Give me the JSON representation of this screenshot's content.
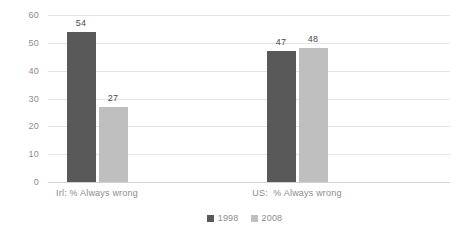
{
  "chart_data": {
    "type": "bar",
    "title": "",
    "subtitle": "",
    "xlabel": "",
    "ylabel": "",
    "ylim": [
      0,
      60
    ],
    "yticks": [
      "0",
      "10",
      "20",
      "30",
      "40",
      "50",
      "60"
    ],
    "grid": true,
    "legend_position": "bottom-center",
    "categories": [
      "Irl: % Always wrong",
      "US:  % Always wrong"
    ],
    "series": [
      {
        "name": "1998",
        "color": "#595959",
        "values": [
          54,
          47
        ]
      },
      {
        "name": "2008",
        "color": "#bfbfbf",
        "values": [
          27,
          48
        ]
      }
    ],
    "data_labels": [
      "54",
      "27",
      "47",
      "48"
    ]
  },
  "axis": {
    "ticks": [
      {
        "label": "60",
        "value": 60
      },
      {
        "label": "50",
        "value": 50
      },
      {
        "label": "40",
        "value": 40
      },
      {
        "label": "30",
        "value": 30
      },
      {
        "label": "20",
        "value": 20
      },
      {
        "label": "10",
        "value": 10
      },
      {
        "label": "0",
        "value": 0
      }
    ]
  },
  "bars": [
    {
      "name": "bar-irl-1998",
      "series": "1998",
      "category": "Irl: % Always wrong",
      "value": 54,
      "label": "54"
    },
    {
      "name": "bar-irl-2008",
      "series": "2008",
      "category": "Irl: % Always wrong",
      "value": 27,
      "label": "27"
    },
    {
      "name": "bar-us-1998",
      "series": "1998",
      "category": "US:  % Always wrong",
      "value": 47,
      "label": "47"
    },
    {
      "name": "bar-us-2008",
      "series": "2008",
      "category": "US:  % Always wrong",
      "value": 48,
      "label": "48"
    }
  ],
  "category_labels": [
    {
      "text": "Irl: % Always wrong"
    },
    {
      "text": "US:  % Always wrong"
    }
  ],
  "legend": {
    "items": [
      {
        "label": "1998",
        "color": "#595959"
      },
      {
        "label": "2008",
        "color": "#bfbfbf"
      }
    ]
  },
  "colors": {
    "series_1998": "#595959",
    "series_2008": "#bfbfbf",
    "gridline": "#e4e4e4",
    "text": "#8c8c8c",
    "background": "#ffffff"
  }
}
